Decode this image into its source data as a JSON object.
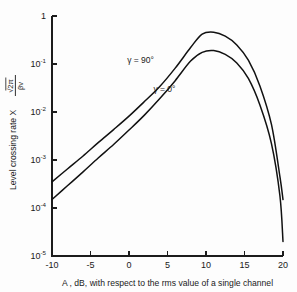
{
  "chart_data": {
    "type": "line",
    "title": "",
    "xlabel": "A , dB, with respect to the rms value of a single channel",
    "ylabel_prefix": "Level crossing rate  X",
    "ylabel_fraction_numerator": "√2π",
    "ylabel_fraction_denominator": "βv",
    "xlim": [
      -10,
      20
    ],
    "ylim": [
      1e-05,
      1
    ],
    "yscale": "log",
    "xticks": [
      -10,
      -5,
      0,
      5,
      10,
      15,
      20
    ],
    "xtick_labels": [
      "-10",
      "-5",
      "0",
      "5",
      "10",
      "15",
      "20"
    ],
    "yticks": [
      1,
      0.1,
      0.01,
      0.001,
      0.0001,
      1e-05
    ],
    "ytick_labels": [
      "1",
      "10",
      "10",
      "10",
      "10",
      "10"
    ],
    "ytick_exponents": [
      "",
      "-1",
      "-2",
      "-3",
      "-4",
      "-5"
    ],
    "grid": false,
    "legend_position": "inline-annotations",
    "series": [
      {
        "name": "γ = 90°",
        "label_x": 1.5,
        "label_y": 0.105,
        "x": [
          -10,
          -8,
          -6,
          -4,
          -2,
          0,
          2,
          4,
          6,
          8,
          9.5,
          11,
          12.5,
          14,
          15.5,
          17,
          18.5,
          19.6,
          20
        ],
        "y": [
          0.00035,
          0.00065,
          0.0012,
          0.0023,
          0.0043,
          0.0082,
          0.0165,
          0.034,
          0.082,
          0.22,
          0.42,
          0.46,
          0.38,
          0.25,
          0.12,
          0.035,
          0.0055,
          0.00045,
          0.00015
        ]
      },
      {
        "name": "γ = 0°",
        "label_x": 4.6,
        "label_y": 0.0255,
        "x": [
          -10,
          -8,
          -6,
          -4,
          -2,
          0,
          2,
          4,
          6,
          8,
          9.5,
          11,
          12.5,
          14,
          15.5,
          17,
          18.5,
          19.6,
          20
        ],
        "y": [
          0.00015,
          0.00029,
          0.00056,
          0.0011,
          0.0021,
          0.0042,
          0.0086,
          0.019,
          0.045,
          0.115,
          0.175,
          0.19,
          0.158,
          0.105,
          0.05,
          0.014,
          0.0022,
          0.00018,
          2e-05
        ]
      }
    ]
  },
  "figure": {
    "curve_color": "#111111",
    "axis_color": "#1c1c1c",
    "background": "#fdfdfd"
  }
}
